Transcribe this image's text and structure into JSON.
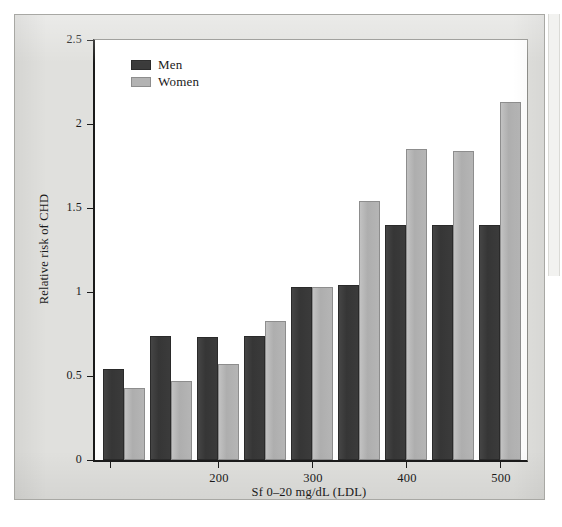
{
  "chart_data": {
    "type": "bar",
    "title": "",
    "xlabel": "Sf 0–20 mg/dL (LDL)",
    "ylabel": "Relative risk of CHD",
    "ylim": [
      0,
      2.5
    ],
    "yticks": [
      "0",
      "0.5",
      "1",
      "1.5",
      "2",
      "2.5"
    ],
    "ytick_values": [
      0,
      0.5,
      1,
      1.5,
      2,
      2.5
    ],
    "xticks": [
      "200",
      "300",
      "400",
      "500",
      "600"
    ],
    "xtick_values": [
      200,
      300,
      400,
      500,
      600
    ],
    "grid": false,
    "legend_position": "top-left",
    "categories": [
      "1",
      "2",
      "3",
      "4",
      "5",
      "6",
      "7",
      "8",
      "9"
    ],
    "series": [
      {
        "name": "Men",
        "color": "#3b3b3b",
        "values": [
          0.54,
          0.74,
          0.73,
          0.74,
          1.03,
          1.04,
          1.4,
          1.4,
          1.4
        ]
      },
      {
        "name": "Women",
        "color": "#b3b3b3",
        "values": [
          0.43,
          0.47,
          0.57,
          0.83,
          1.03,
          1.54,
          1.85,
          1.84,
          2.13
        ]
      }
    ],
    "extra_series_note": ""
  },
  "legend": {
    "items": [
      {
        "label": "Men",
        "swatch": "men-swatch"
      },
      {
        "label": "Women",
        "swatch": "women-swatch"
      }
    ]
  },
  "axes": {
    "y_title": "Relative risk of CHD",
    "x_title": "Sf 0–20 mg/dL (LDL)",
    "y_labels": [
      "2.5",
      "2",
      "1.5",
      "1",
      "0.5",
      "0"
    ],
    "x_labels": [
      "200",
      "300",
      "400",
      "500",
      "600"
    ]
  },
  "colors": {
    "men_bar": "#3b3b3b",
    "women_bar": "#b3b3b3",
    "panel_background": "#e0e0dd",
    "plot_background": "#ffffff",
    "axis": "#1a1a1a"
  }
}
